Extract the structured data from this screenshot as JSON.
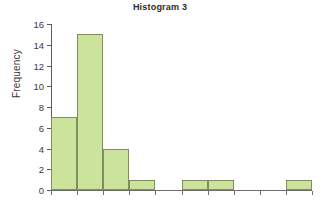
{
  "chart_data": {
    "type": "bar",
    "title": "Histogram 3",
    "xlabel": "",
    "ylabel": "Frequency",
    "categories": [
      "1",
      "2",
      "3",
      "4",
      "5",
      "6",
      "7",
      "8",
      "9",
      "10"
    ],
    "values": [
      7,
      15,
      4,
      1,
      0,
      1,
      1,
      0,
      0,
      1
    ],
    "ylim": [
      0,
      16
    ],
    "ytick_labels": [
      "0",
      "2",
      "4",
      "6",
      "8",
      "10",
      "12",
      "14",
      "16"
    ],
    "ytick_values": [
      0,
      2,
      4,
      6,
      8,
      10,
      12,
      14,
      16
    ],
    "xtick_labels": [
      "",
      "",
      "",
      "",
      "",
      "",
      "",
      "",
      "",
      "",
      ""
    ],
    "grid": false,
    "legend": "none",
    "bar_fill_color": "#cce39b",
    "bar_border_color": "#808e5d",
    "axis_color": "#5a5a5a",
    "text_color": "#3a3a3a"
  }
}
